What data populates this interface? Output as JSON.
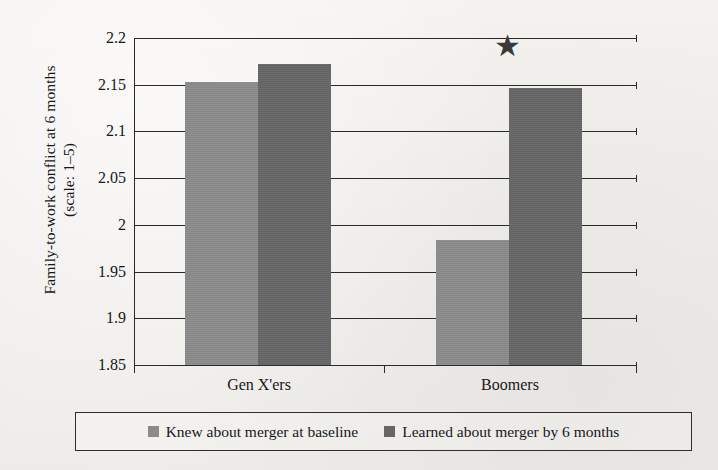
{
  "chart_data": {
    "type": "bar",
    "title": "",
    "subtitle": "",
    "xlabel": "",
    "ylabel": "Family-to-work conflict at 6 months\n(scale: 1–5)",
    "categories": [
      "Gen X'ers",
      "Boomers"
    ],
    "series": [
      {
        "name": "Knew about merger at baseline",
        "color": "#8b8b8b",
        "values": [
          2.153,
          1.984
        ]
      },
      {
        "name": "Learned about merger by 6 months",
        "color": "#666666",
        "values": [
          2.172,
          2.146
        ]
      }
    ],
    "ylim": [
      1.85,
      2.2
    ],
    "ytick_labels": [
      "2.2",
      "2.15",
      "2.1",
      "2.05",
      "2",
      "1.95",
      "1.9",
      "1.85"
    ],
    "ytick_values": [
      2.2,
      2.15,
      2.1,
      2.05,
      2.0,
      1.95,
      1.9,
      1.85
    ],
    "grid": true,
    "legend_position": "bottom",
    "annotations": [
      {
        "symbol": "★",
        "name": "significance-star",
        "category": "Boomers",
        "meaning": "significant difference"
      }
    ]
  },
  "axis": {
    "y_title_line1": "Family-to-work conflict at 6 months",
    "y_title_line2": "(scale: 1–5)"
  },
  "legend": {
    "entries": [
      {
        "label": "Knew about merger at baseline",
        "color": "#8b8b8b"
      },
      {
        "label": "Learned about merger by 6 months",
        "color": "#666666"
      }
    ]
  }
}
